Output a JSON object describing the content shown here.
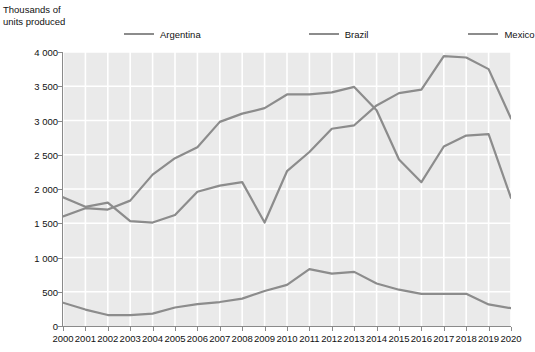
{
  "axis_caption": "Thousands of units produced",
  "legend": {
    "items": [
      {
        "label": "Argentina",
        "color": "#8c8c8c"
      },
      {
        "label": "Brazil",
        "color": "#8c8c8c"
      },
      {
        "label": "Mexico",
        "color": "#8c8c8c"
      }
    ]
  },
  "colors": {
    "plot_background": "#eaeaea",
    "gridline": "#ffffff",
    "axis": "#8a8a8a",
    "line": "#8c8c8c",
    "text": "#111111"
  },
  "y_ticks": [
    "0",
    "500",
    "1 000",
    "1 500",
    "2 000",
    "2 500",
    "3 000",
    "3 500",
    "4 000"
  ],
  "x_ticks": [
    "2000",
    "2001",
    "2002",
    "2003",
    "2004",
    "2005",
    "2006",
    "2007",
    "2008",
    "2009",
    "2010",
    "2011",
    "2012",
    "2013",
    "2014",
    "2015",
    "2016",
    "2017",
    "2018",
    "2019",
    "2020"
  ],
  "chart_data": {
    "type": "line",
    "title": "",
    "xlabel": "",
    "ylabel": "Thousands of units produced",
    "ylim": [
      0,
      4000
    ],
    "ytick_step": 500,
    "grid": true,
    "legend_position": "top",
    "categories": [
      "2000",
      "2001",
      "2002",
      "2003",
      "2004",
      "2005",
      "2006",
      "2007",
      "2008",
      "2009",
      "2010",
      "2011",
      "2012",
      "2013",
      "2014",
      "2015",
      "2016",
      "2017",
      "2018",
      "2019",
      "2020"
    ],
    "series": [
      {
        "name": "Argentina",
        "color": "#8c8c8c",
        "values": [
          340,
          240,
          160,
          160,
          180,
          270,
          320,
          350,
          400,
          510,
          600,
          830,
          765,
          790,
          620,
          530,
          470,
          470,
          470,
          315,
          260
        ]
      },
      {
        "name": "Brazil",
        "color": "#8c8c8c",
        "values": [
          1600,
          1720,
          1700,
          1830,
          2210,
          2450,
          2610,
          2980,
          3100,
          3180,
          3380,
          3380,
          3410,
          3490,
          3150,
          2430,
          2100,
          2620,
          2780,
          2800,
          1870
        ]
      },
      {
        "name": "Mexico",
        "color": "#8c8c8c",
        "values": [
          1880,
          1740,
          1800,
          1530,
          1510,
          1620,
          1960,
          2050,
          2100,
          1510,
          2260,
          2540,
          2880,
          2930,
          3220,
          3400,
          3450,
          3940,
          3920,
          3750,
          3030
        ]
      }
    ]
  }
}
